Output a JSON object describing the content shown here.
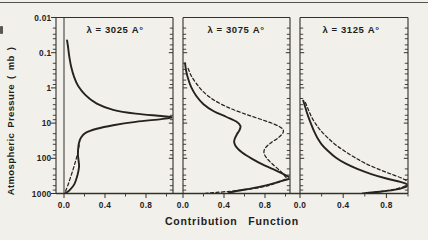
{
  "figure": {
    "xlabel": "Contribution Function",
    "ylabel": "Atmospheric Pressure ( mb )",
    "colors": {
      "background": "#f2f0ea",
      "ink": "#26231f",
      "frame": "#33302b"
    }
  },
  "chart_data": {
    "type": "line",
    "title": "",
    "xlabel": "Contribution Function",
    "ylabel": "Atmospheric Pressure ( mb )",
    "y_scale": "log-inverted",
    "ylim": [
      0.01,
      1000
    ],
    "y_tick_labels": [
      "0.01",
      "0.1",
      "1",
      "10",
      "100",
      "1000"
    ],
    "y_tick_values": [
      0.01,
      0.1,
      1,
      10,
      100,
      1000
    ],
    "y_minor_multipliers": [
      2,
      3,
      4,
      6,
      8
    ],
    "xlim": [
      0,
      1.06
    ],
    "x_tick_labels": [
      "0.0",
      "0.4",
      "0.8"
    ],
    "x_tick_values": [
      0.0,
      0.4,
      0.8
    ],
    "x_minor_values": [
      0.2,
      0.6,
      1.0
    ],
    "grid": false,
    "legend": "none",
    "panels": [
      {
        "label": "λ = 3025 A°",
        "series": [
          {
            "name": "solid",
            "style": "solid",
            "points": [
              [
                0.03,
                0.045
              ],
              [
                0.04,
                0.07
              ],
              [
                0.05,
                0.12
              ],
              [
                0.07,
                0.25
              ],
              [
                0.1,
                0.5
              ],
              [
                0.14,
                0.9
              ],
              [
                0.21,
                1.6
              ],
              [
                0.32,
                2.8
              ],
              [
                0.48,
                4.2
              ],
              [
                0.7,
                5.4
              ],
              [
                0.95,
                6.3
              ],
              [
                1.06,
                6.9
              ],
              [
                0.95,
                7.7
              ],
              [
                0.7,
                9.2
              ],
              [
                0.48,
                11.5
              ],
              [
                0.32,
                14.5
              ],
              [
                0.21,
                19
              ],
              [
                0.165,
                26
              ],
              [
                0.145,
                38
              ],
              [
                0.138,
                55
              ],
              [
                0.136,
                80
              ],
              [
                0.142,
                115
              ],
              [
                0.147,
                165
              ],
              [
                0.14,
                235
              ],
              [
                0.125,
                350
              ],
              [
                0.1,
                550
              ],
              [
                0.06,
                780
              ],
              [
                0.025,
                940
              ],
              [
                0.012,
                1000
              ]
            ]
          },
          {
            "name": "dashed",
            "style": "dashed",
            "points": [
              [
                0.148,
                42
              ],
              [
                0.138,
                60
              ],
              [
                0.125,
                90
              ],
              [
                0.108,
                135
              ],
              [
                0.088,
                210
              ],
              [
                0.062,
                360
              ],
              [
                0.038,
                580
              ],
              [
                0.018,
                820
              ],
              [
                0.006,
                1000
              ]
            ]
          }
        ]
      },
      {
        "label": "λ = 3075 A°",
        "series": [
          {
            "name": "solid",
            "style": "solid",
            "points": [
              [
                0.02,
                0.2
              ],
              [
                0.03,
                0.32
              ],
              [
                0.05,
                0.55
              ],
              [
                0.08,
                0.95
              ],
              [
                0.13,
                1.7
              ],
              [
                0.2,
                2.9
              ],
              [
                0.3,
                4.6
              ],
              [
                0.42,
                6.6
              ],
              [
                0.52,
                9
              ],
              [
                0.56,
                12
              ],
              [
                0.55,
                16
              ],
              [
                0.525,
                21
              ],
              [
                0.505,
                28
              ],
              [
                0.5,
                36
              ],
              [
                0.525,
                50
              ],
              [
                0.58,
                70
              ],
              [
                0.67,
                102
              ],
              [
                0.78,
                152
              ],
              [
                0.91,
                225
              ],
              [
                1.0,
                300
              ],
              [
                1.04,
                370
              ],
              [
                0.93,
                470
              ],
              [
                0.8,
                600
              ],
              [
                0.62,
                760
              ],
              [
                0.5,
                880
              ],
              [
                0.45,
                960
              ],
              [
                0.44,
                1000
              ]
            ]
          },
          {
            "name": "dashed",
            "style": "dashed",
            "points": [
              [
                0.05,
                0.28
              ],
              [
                0.08,
                0.45
              ],
              [
                0.13,
                0.75
              ],
              [
                0.2,
                1.3
              ],
              [
                0.3,
                2.2
              ],
              [
                0.45,
                3.7
              ],
              [
                0.62,
                5.7
              ],
              [
                0.78,
                8.2
              ],
              [
                0.9,
                11
              ],
              [
                0.97,
                14.5
              ],
              [
                0.975,
                19
              ],
              [
                0.93,
                26
              ],
              [
                0.86,
                36
              ],
              [
                0.805,
                50
              ],
              [
                0.79,
                70
              ],
              [
                0.82,
                102
              ],
              [
                0.88,
                152
              ],
              [
                0.945,
                225
              ],
              [
                0.99,
                310
              ],
              [
                1.0,
                385
              ],
              [
                0.9,
                520
              ],
              [
                0.75,
                680
              ],
              [
                0.52,
                830
              ],
              [
                0.33,
                930
              ],
              [
                0.22,
                995
              ]
            ]
          }
        ]
      },
      {
        "label": "λ = 3125 A°",
        "series": [
          {
            "name": "solid",
            "style": "solid",
            "points": [
              [
                0.03,
                2.3
              ],
              [
                0.045,
                3.2
              ],
              [
                0.06,
                4.6
              ],
              [
                0.08,
                7
              ],
              [
                0.105,
                11
              ],
              [
                0.13,
                17
              ],
              [
                0.16,
                26
              ],
              [
                0.2,
                40
              ],
              [
                0.26,
                62
              ],
              [
                0.33,
                95
              ],
              [
                0.42,
                140
              ],
              [
                0.53,
                200
              ],
              [
                0.66,
                280
              ],
              [
                0.8,
                375
              ],
              [
                0.93,
                470
              ],
              [
                1.0,
                570
              ],
              [
                0.96,
                680
              ],
              [
                0.87,
                790
              ],
              [
                0.74,
                890
              ],
              [
                0.62,
                960
              ],
              [
                0.58,
                1000
              ]
            ]
          },
          {
            "name": "dashed",
            "style": "dashed",
            "points": [
              [
                0.05,
                2.6
              ],
              [
                0.075,
                4
              ],
              [
                0.105,
                6.5
              ],
              [
                0.145,
                10.5
              ],
              [
                0.19,
                16
              ],
              [
                0.25,
                25
              ],
              [
                0.32,
                39
              ],
              [
                0.405,
                60
              ],
              [
                0.5,
                92
              ],
              [
                0.6,
                137
              ],
              [
                0.715,
                197
              ],
              [
                0.835,
                275
              ],
              [
                0.945,
                370
              ],
              [
                1.0,
                480
              ],
              [
                0.98,
                600
              ],
              [
                0.89,
                740
              ],
              [
                0.77,
                860
              ],
              [
                0.66,
                945
              ],
              [
                0.62,
                995
              ]
            ]
          }
        ]
      }
    ]
  }
}
